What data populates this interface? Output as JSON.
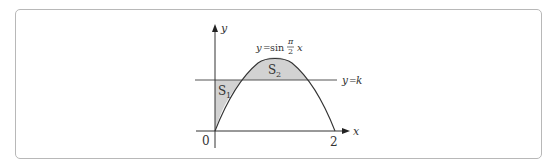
{
  "diagram": {
    "type": "function-graph",
    "function_label": {
      "lhs": "y",
      "eq": "=",
      "fn": "sin",
      "frac_num": "π",
      "frac_den": "2",
      "var": "x"
    },
    "axis_labels": {
      "x": "x",
      "y": "y",
      "origin": "0",
      "x_tick": "2"
    },
    "line_label": {
      "lhs": "y",
      "eq": "=",
      "rhs": "k"
    },
    "regions": [
      {
        "name": "S",
        "sub": "1"
      },
      {
        "name": "S",
        "sub": "2"
      }
    ],
    "colors": {
      "axis": "#333333",
      "curve": "#333333",
      "fill": "#d2d2d2",
      "frame": "#b8b8b8"
    }
  }
}
